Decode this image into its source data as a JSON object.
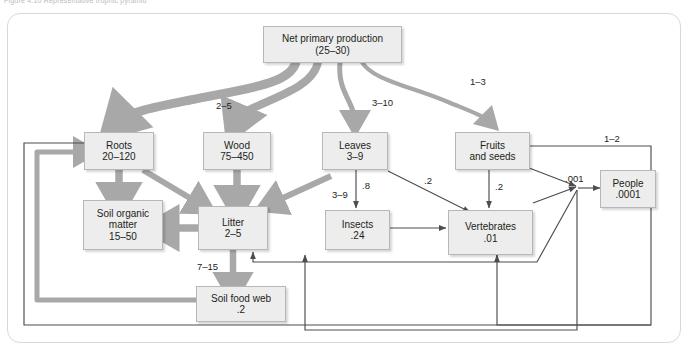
{
  "figure": {
    "caption_fragment": "Figure 4.10   Representative trophic pyramid"
  },
  "diagram": {
    "colors": {
      "box_fill": "#ededed",
      "box_border": "#b7b7b7",
      "thick_flow": "#a8a8a8",
      "thin_flow": "#4d4d4d",
      "frame_border": "#d8d8da",
      "text": "#231f20"
    },
    "nodes": [
      {
        "id": "npp",
        "name": "net-primary-production",
        "line1": "Net primary production",
        "line2": "(25–30)"
      },
      {
        "id": "roots",
        "name": "roots",
        "line1": "Roots",
        "line2": "20–120"
      },
      {
        "id": "wood",
        "name": "wood",
        "line1": "Wood",
        "line2": "75–450"
      },
      {
        "id": "leaves",
        "name": "leaves",
        "line1": "Leaves",
        "line2": "3–9"
      },
      {
        "id": "fruits",
        "name": "fruits-and-seeds",
        "line1": "Fruits",
        "line2": "and seeds"
      },
      {
        "id": "som",
        "name": "soil-organic-matter",
        "line1": "Soil organic",
        "line2": "matter",
        "line3": "15–50"
      },
      {
        "id": "litter",
        "name": "litter",
        "line1": "Litter",
        "line2": "2–5"
      },
      {
        "id": "insects",
        "name": "insects",
        "line1": "Insects",
        "line2": ".24"
      },
      {
        "id": "vertebrates",
        "name": "vertebrates",
        "line1": "Vertebrates",
        "line2": ".01"
      },
      {
        "id": "people",
        "name": "people",
        "line1": "People",
        "line2": ".0001"
      },
      {
        "id": "soilfoodweb",
        "name": "soil-food-web",
        "line1": "Soil food web",
        "line2": ".2"
      }
    ],
    "edges": [
      {
        "id": "e_npp_roots",
        "from": "npp",
        "to": "roots",
        "label": "",
        "style": "thick"
      },
      {
        "id": "e_npp_wood",
        "from": "npp",
        "to": "wood",
        "label": "2–5",
        "style": "thick"
      },
      {
        "id": "e_npp_leaves",
        "from": "npp",
        "to": "leaves",
        "label": "3–10",
        "style": "thick"
      },
      {
        "id": "e_npp_fruits",
        "from": "npp",
        "to": "fruits",
        "label": "1–3",
        "style": "thick"
      },
      {
        "id": "e_roots_som",
        "from": "roots",
        "to": "som",
        "label": "",
        "style": "thick"
      },
      {
        "id": "e_roots_litter",
        "from": "roots",
        "to": "litter",
        "label": "",
        "style": "thick"
      },
      {
        "id": "e_wood_litter",
        "from": "wood",
        "to": "litter",
        "label": "",
        "style": "thick"
      },
      {
        "id": "e_leaves_litter",
        "from": "leaves",
        "to": "litter",
        "label": "3–9",
        "style": "thick"
      },
      {
        "id": "e_litter_som",
        "from": "litter",
        "to": "som",
        "label": "",
        "style": "thick"
      },
      {
        "id": "e_litter_sfw",
        "from": "litter",
        "to": "soilfoodweb",
        "label": "7–15",
        "style": "thick"
      },
      {
        "id": "e_sfw_roots",
        "from": "soilfoodweb",
        "to": "roots",
        "label": "",
        "style": "thick"
      },
      {
        "id": "e_leaves_insects",
        "from": "leaves",
        "to": "insects",
        "label": ".8",
        "style": "thin"
      },
      {
        "id": "e_leaves_verts",
        "from": "leaves",
        "to": "vertebrates",
        "label": ".2",
        "style": "thin"
      },
      {
        "id": "e_fruits_verts",
        "from": "fruits",
        "to": "vertebrates",
        "label": ".2",
        "style": "thin"
      },
      {
        "id": "e_fruits_people",
        "from": "fruits",
        "to": "people",
        "label": ".001",
        "style": "thin"
      },
      {
        "id": "e_fruits_loop",
        "from": "fruits",
        "to": "litter",
        "label": "1–2",
        "style": "thin"
      },
      {
        "id": "e_insects_verts",
        "from": "insects",
        "to": "vertebrates",
        "label": "",
        "style": "thin"
      },
      {
        "id": "e_verts_litter",
        "from": "vertebrates",
        "to": "litter",
        "label": "",
        "style": "thin"
      },
      {
        "id": "e_people_verts",
        "from": "people",
        "to": "vertebrates",
        "label": "",
        "style": "thin"
      }
    ],
    "labels": [
      {
        "id": "l_2_5",
        "name": "label-npp-wood",
        "text": "2–5"
      },
      {
        "id": "l_3_10",
        "name": "label-npp-leaves",
        "text": "3–10"
      },
      {
        "id": "l_1_3",
        "name": "label-npp-fruits",
        "text": "1–3"
      },
      {
        "id": "l_3_9",
        "name": "label-leaves-litter",
        "text": "3–9"
      },
      {
        "id": "l_08",
        "name": "label-leaves-insects",
        "text": ".8"
      },
      {
        "id": "l_02a",
        "name": "label-leaves-vertebrates",
        "text": ".2"
      },
      {
        "id": "l_02b",
        "name": "label-fruits-vertebrates",
        "text": ".2"
      },
      {
        "id": "l_001",
        "name": "label-vertebrates-people",
        "text": ".001"
      },
      {
        "id": "l_1_2",
        "name": "label-fruits-loop",
        "text": "1–2"
      },
      {
        "id": "l_7_15",
        "name": "label-litter-soilfoodweb",
        "text": "7–15"
      }
    ]
  }
}
